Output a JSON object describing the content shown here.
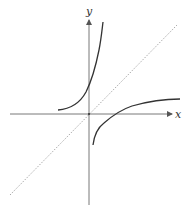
{
  "diagram": {
    "title": "",
    "axes": {
      "x_label": "x",
      "y_label": "y",
      "origin_px": [
        89,
        114
      ]
    },
    "curves": [
      {
        "name": "exponential",
        "expression": "y = e^x",
        "color": "#333333",
        "style": "solid"
      },
      {
        "name": "logarithm",
        "expression": "y = ln x",
        "color": "#333333",
        "style": "solid"
      },
      {
        "name": "identity-line",
        "expression": "y = x",
        "color": "#aaaaaa",
        "style": "dotted"
      }
    ],
    "colors": {
      "axis": "#555555",
      "curve": "#333333",
      "reflection_line": "#aaaaaa",
      "background": "#ffffff"
    }
  }
}
